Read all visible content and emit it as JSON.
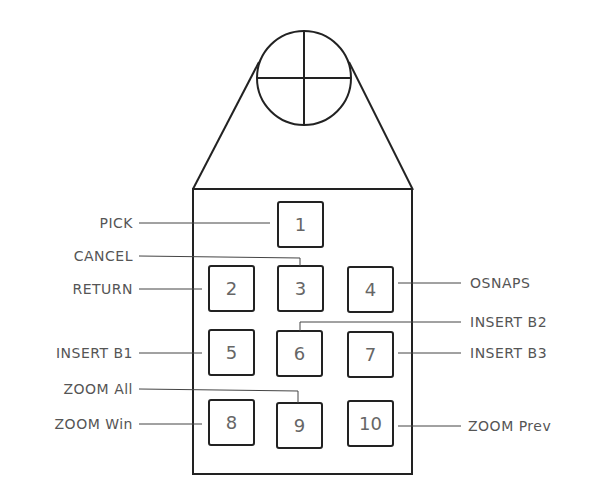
{
  "diagram": {
    "puck": {
      "crosshair": {
        "cx": 304,
        "cy": 78,
        "r": 47
      },
      "body": {
        "x": 193,
        "y": 189,
        "w": 219,
        "h": 285
      }
    },
    "buttons": [
      {
        "id": "1",
        "x": 278,
        "y": 202,
        "label": "PICK",
        "side": "left"
      },
      {
        "id": "2",
        "x": 209,
        "y": 266,
        "label": "RETURN",
        "side": "left"
      },
      {
        "id": "3",
        "x": 278,
        "y": 266,
        "label": "CANCEL",
        "side": "left"
      },
      {
        "id": "4",
        "x": 348,
        "y": 266,
        "label": "OSNAPS",
        "side": "right"
      },
      {
        "id": "5",
        "x": 209,
        "y": 331,
        "label": "INSERT  B1",
        "side": "left"
      },
      {
        "id": "6",
        "x": 278,
        "y": 331,
        "label": "INSERT  B2",
        "side": "right"
      },
      {
        "id": "7",
        "x": 348,
        "y": 331,
        "label": "INSERT  B3",
        "side": "right"
      },
      {
        "id": "8",
        "x": 209,
        "y": 401,
        "label": "ZOOM  Win",
        "side": "left"
      },
      {
        "id": "9",
        "x": 278,
        "y": 402,
        "label": "ZOOM  All",
        "side": "left"
      },
      {
        "id": "10",
        "x": 348,
        "y": 401,
        "label": "ZOOM  Prev",
        "side": "right"
      }
    ],
    "labels": {
      "pick": "PICK",
      "cancel": "CANCEL",
      "return": "RETURN",
      "osnaps": "OSNAPS",
      "insert_b1": "INSERT  B1",
      "insert_b2": "INSERT  B2",
      "insert_b3": "INSERT  B3",
      "zoom_all": "ZOOM  All",
      "zoom_win": "ZOOM  Win",
      "zoom_prev": "ZOOM  Prev"
    },
    "colors": {
      "line": "#222222",
      "text": "#555555",
      "background": "#ffffff"
    }
  }
}
